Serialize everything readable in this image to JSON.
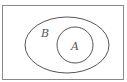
{
  "diagram": {
    "type": "venn",
    "universe": {
      "label": ""
    },
    "sets": [
      {
        "label": "B",
        "role": "outer"
      },
      {
        "label": "A",
        "role": "inner",
        "subset_of": "B"
      }
    ],
    "colors": {
      "stroke": "#555555",
      "background": "#ffffff"
    }
  }
}
